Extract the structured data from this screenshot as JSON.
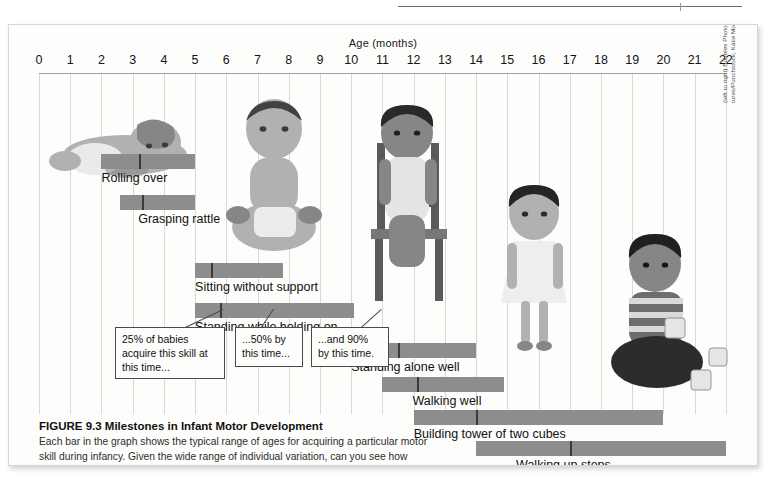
{
  "figure": {
    "number": "FIGURE 9.3",
    "title": "Milestones in Infant Motor Development",
    "body": "Each bar in the graph shows the typical range of ages for acquiring a particular motor skill during infancy. Given the wide range of individual variation, can you see how simple statistical averages may be misleading?"
  },
  "axis": {
    "title": "Age (months)",
    "ticks": [
      "0",
      "1",
      "2",
      "3",
      "4",
      "5",
      "6",
      "7",
      "8",
      "9",
      "10",
      "11",
      "12",
      "13",
      "14",
      "15",
      "16",
      "17",
      "18",
      "19",
      "20",
      "21",
      "22"
    ],
    "min": 0,
    "max": 22,
    "unit": "months"
  },
  "callouts": [
    {
      "id": "p25",
      "text": "25% of babies acquire this skill at this time..."
    },
    {
      "id": "p50",
      "text": "...50% by this time..."
    },
    {
      "id": "p90",
      "text": "...and 90% by this time."
    }
  ],
  "credit": {
    "line1": "(left to right) Bubbles Photolibrary/Alamy; Image Source/Getty Images; Brand X Pic-",
    "line2": "tures/Punchstock; Katie Moss/Jupiterimages; Jupiterimages/BananaStock/Alamy"
  },
  "colors": {
    "bar": "#8d8d8d",
    "median": "#3a3a3a",
    "grid": "#d9d9d6",
    "axis": "#9d9d9d",
    "card": "#fdfdfb",
    "text": "#101010"
  },
  "chart_data": {
    "type": "bar",
    "title": "Milestones in Infant Motor Development",
    "xlabel": "Age (months)",
    "ylabel": "",
    "xlim": [
      0,
      22
    ],
    "grid": true,
    "legend": "none",
    "orientation": "horizontal",
    "bar_encoding": "range bar: left edge = 25th percentile, interior line = 50th percentile (median), right edge = 90th percentile",
    "categories": [
      "Rolling over",
      "Grasping rattle",
      "Sitting without support",
      "Standing while holding on",
      "Standing alone well",
      "Walking well",
      "Building tower of two cubes",
      "Walking up steps"
    ],
    "series": [
      {
        "name": "25th percentile",
        "values": [
          2.0,
          2.6,
          5.0,
          5.0,
          10.0,
          11.0,
          12.0,
          14.0
        ]
      },
      {
        "name": "50th percentile",
        "values": [
          3.2,
          3.3,
          5.5,
          5.8,
          11.5,
          12.1,
          14.0,
          17.0
        ]
      },
      {
        "name": "90th percentile",
        "values": [
          5.0,
          5.0,
          7.8,
          10.1,
          14.0,
          14.9,
          20.0,
          22.0
        ]
      }
    ],
    "bars": [
      {
        "label": "Rolling over",
        "p25": 2.0,
        "p50": 3.2,
        "p90": 5.0
      },
      {
        "label": "Grasping rattle",
        "p25": 2.6,
        "p50": 3.3,
        "p90": 5.0
      },
      {
        "label": "Sitting without support",
        "p25": 5.0,
        "p50": 5.5,
        "p90": 7.8
      },
      {
        "label": "Standing while holding on",
        "p25": 5.0,
        "p50": 5.8,
        "p90": 10.1
      },
      {
        "label": "Standing alone well",
        "p25": 10.0,
        "p50": 11.5,
        "p90": 14.0
      },
      {
        "label": "Walking well",
        "p25": 11.0,
        "p50": 12.1,
        "p90": 14.9
      },
      {
        "label": "Building tower of two cubes",
        "p25": 12.0,
        "p50": 14.0,
        "p90": 20.0
      },
      {
        "label": "Walking up steps",
        "p25": 14.0,
        "p50": 17.0,
        "p90": 22.0
      }
    ],
    "annotations": [
      "25% of babies acquire this skill at this time...",
      "...50% by this time...",
      "...and 90% by this time."
    ]
  },
  "photos": [
    {
      "name": "baby-rolling-over"
    },
    {
      "name": "baby-sitting"
    },
    {
      "name": "baby-standing-at-chair"
    },
    {
      "name": "toddler-standing"
    },
    {
      "name": "toddler-with-blocks"
    }
  ]
}
